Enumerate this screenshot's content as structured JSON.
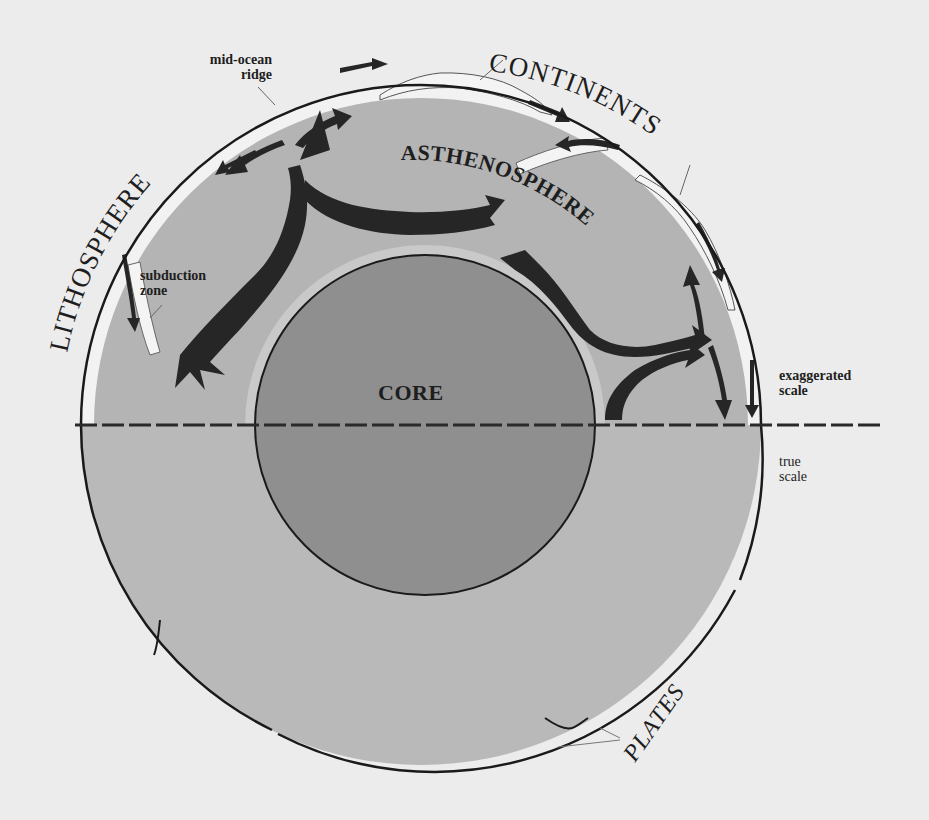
{
  "diagram": {
    "labels": {
      "core": "CORE",
      "asthenosphere": "ASTHENOSPHERE",
      "lithosphere": "LITHOSPHERE",
      "continents": "CONTINENTS",
      "plates": "PLATES",
      "mid_ocean_ridge_line1": "mid-ocean",
      "mid_ocean_ridge_line2": "ridge",
      "subduction_zone_line1": "subduction",
      "subduction_zone_line2": "zone",
      "exaggerated_scale_line1": "exaggerated",
      "exaggerated_scale_line2": "scale",
      "true_scale_line1": "true",
      "true_scale_line2": "scale"
    },
    "colors": {
      "background": "#ececec",
      "mantle": "#b4b4b4",
      "mantle_lower": "#b9b9b9",
      "core": "#8f8f8f",
      "lithosphere": "#f2f2f2",
      "arrows": "#262626",
      "outline": "#1a1a1a"
    }
  }
}
